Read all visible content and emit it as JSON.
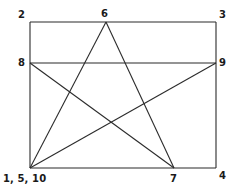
{
  "figure": {
    "type": "geometric-diagram",
    "canvas": {
      "width": 238,
      "height": 196
    },
    "stroke_color": "#2b2b2b",
    "label_color": "#1a1a1a",
    "background_color": "#ffffff",
    "stroke_width": 1,
    "rectangle": {
      "name": "bounding-rectangle",
      "x": 30,
      "y": 22,
      "width": 186,
      "height": 146,
      "corners": {
        "top_left": [
          30,
          22
        ],
        "top_right": [
          216,
          22
        ],
        "bottom_right": [
          216,
          168
        ],
        "bottom_left": [
          30,
          168
        ]
      }
    },
    "points": [
      {
        "id": "p1",
        "label": "1, 5, 10",
        "x": 30,
        "y": 168,
        "anchor": "bottom-left"
      },
      {
        "id": "p2",
        "label": "2",
        "x": 30,
        "y": 22,
        "anchor": "top-left"
      },
      {
        "id": "p3",
        "label": "3",
        "x": 216,
        "y": 22,
        "anchor": "top-right"
      },
      {
        "id": "p4",
        "label": "4",
        "x": 216,
        "y": 168,
        "anchor": "bottom-right"
      },
      {
        "id": "p6",
        "label": "6",
        "x": 106,
        "y": 22,
        "anchor": "top-edge"
      },
      {
        "id": "p7",
        "label": "7",
        "x": 174,
        "y": 168,
        "anchor": "bottom-edge"
      },
      {
        "id": "p8",
        "label": "8",
        "x": 30,
        "y": 63,
        "anchor": "left-edge"
      },
      {
        "id": "p9",
        "label": "9",
        "x": 216,
        "y": 63,
        "anchor": "right-edge"
      }
    ],
    "segments": [
      {
        "name": "rect-top",
        "from": [
          30,
          22
        ],
        "to": [
          216,
          22
        ]
      },
      {
        "name": "rect-right",
        "from": [
          216,
          22
        ],
        "to": [
          216,
          168
        ]
      },
      {
        "name": "rect-bottom",
        "from": [
          216,
          168
        ],
        "to": [
          30,
          168
        ]
      },
      {
        "name": "rect-left",
        "from": [
          30,
          168
        ],
        "to": [
          30,
          22
        ]
      },
      {
        "name": "chord-8-9",
        "from": [
          30,
          63
        ],
        "to": [
          216,
          63
        ]
      },
      {
        "name": "star-1-6",
        "from": [
          30,
          168
        ],
        "to": [
          106,
          22
        ]
      },
      {
        "name": "star-6-7",
        "from": [
          106,
          22
        ],
        "to": [
          174,
          168
        ]
      },
      {
        "name": "star-7-8",
        "from": [
          174,
          168
        ],
        "to": [
          30,
          63
        ]
      },
      {
        "name": "star-9-1",
        "from": [
          216,
          63
        ],
        "to": [
          30,
          168
        ]
      }
    ],
    "labels": {
      "corner_top_left": "2",
      "corner_top_right": "3",
      "corner_bottom_right": "4",
      "apex_top": "6",
      "vertex_bottom_right": "7",
      "vertex_left": "8",
      "vertex_right": "9",
      "vertex_bottom_left": "1, 5, 10"
    }
  }
}
